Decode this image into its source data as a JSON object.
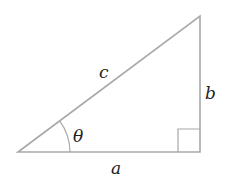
{
  "diagram": {
    "type": "right-triangle",
    "labels": {
      "hypotenuse": "c",
      "opposite": "b",
      "adjacent": "a",
      "angle": "θ"
    },
    "colors": {
      "line": "#a8a8a8",
      "text": "#222222",
      "background": "#ffffff"
    }
  }
}
